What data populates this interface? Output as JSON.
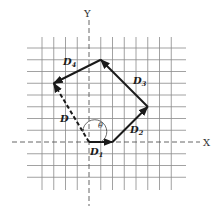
{
  "diagram": {
    "type": "vector-addition",
    "axes": {
      "x_label": "X",
      "y_label": "Y"
    },
    "grid": {
      "cols_from": -4,
      "cols_to": 7,
      "rows_from": -3,
      "rows_to": 8
    },
    "angle_label": "θ",
    "vectors": [
      {
        "name": "D1",
        "letter": "D",
        "subscript": "1",
        "from": [
          0,
          0
        ],
        "to": [
          2,
          0
        ],
        "style": "solid"
      },
      {
        "name": "D2",
        "letter": "D",
        "subscript": "2",
        "from": [
          2,
          0
        ],
        "to": [
          5,
          3
        ],
        "style": "solid"
      },
      {
        "name": "D3",
        "letter": "D",
        "subscript": "3",
        "from": [
          5,
          3
        ],
        "to": [
          1,
          7
        ],
        "style": "solid"
      },
      {
        "name": "D4",
        "letter": "D",
        "subscript": "4",
        "from": [
          1,
          7
        ],
        "to": [
          -3,
          5
        ],
        "style": "solid"
      },
      {
        "name": "D",
        "letter": "D",
        "subscript": "",
        "from": [
          0,
          0
        ],
        "to": [
          -3,
          5
        ],
        "style": "dashed"
      }
    ],
    "labels": {
      "d1": {
        "letter": "D",
        "sub": "1"
      },
      "d2": {
        "letter": "D",
        "sub": "2"
      },
      "d3": {
        "letter": "D",
        "sub": "3"
      },
      "d4": {
        "letter": "D",
        "sub": "4"
      },
      "d": {
        "letter": "D"
      }
    }
  }
}
